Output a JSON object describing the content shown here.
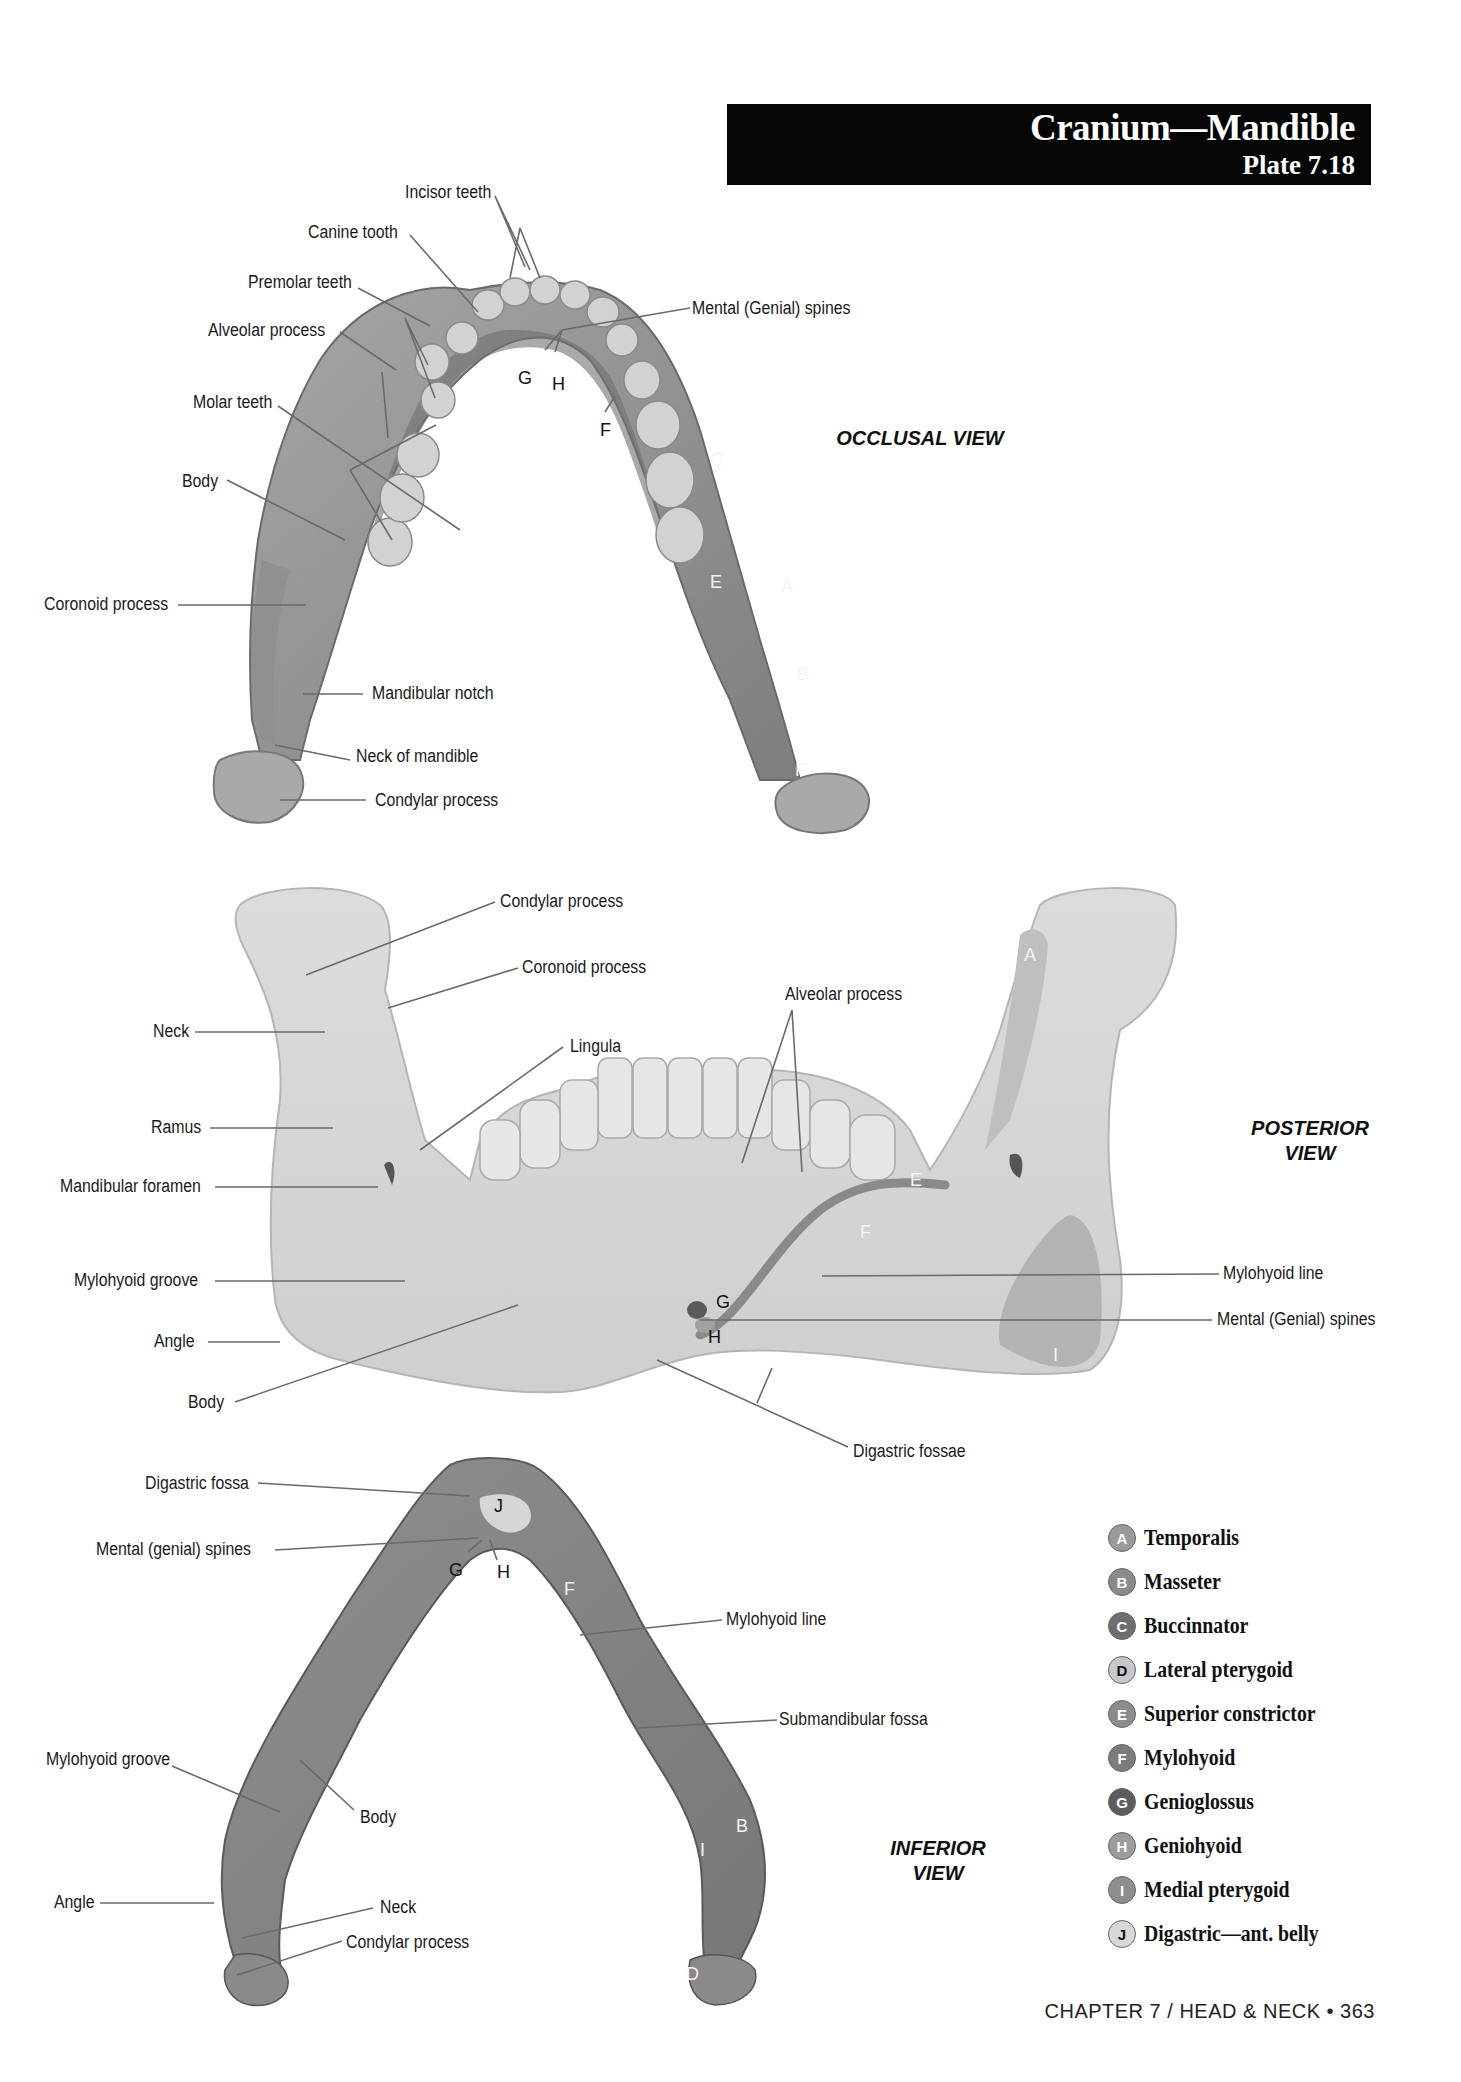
{
  "header": {
    "title": "Cranium—Mandible",
    "plate": "Plate 7.18"
  },
  "occlusal_view": {
    "view_label": [
      "OCCLUSAL",
      "VIEW"
    ],
    "labels": {
      "incisor_teeth": "Incisor teeth",
      "canine_tooth": "Canine tooth",
      "premolar_teeth": "Premolar teeth",
      "alveolar_process": "Alveolar process",
      "molar_teeth": "Molar teeth",
      "body": "Body",
      "coronoid_process": "Coronoid process",
      "mandibular_notch": "Mandibular notch",
      "neck_of_mandible": "Neck of mandible",
      "condylar_process": "Condylar process",
      "mental_spines": "Mental (Genial) spines"
    },
    "markers": {
      "G": "G",
      "H": "H",
      "F": "F",
      "C": "C",
      "E": "E",
      "A": "A",
      "B": "B",
      "F2": "F"
    }
  },
  "posterior_view": {
    "view_label": [
      "POSTERIOR",
      "VIEW"
    ],
    "labels": {
      "condylar_process": "Condylar process",
      "coronoid_process": "Coronoid process",
      "neck": "Neck",
      "lingula": "Lingula",
      "alveolar_process": "Alveolar process",
      "ramus": "Ramus",
      "mandibular_foramen": "Mandibular foramen",
      "mylohyoid_groove": "Mylohyoid groove",
      "angle": "Angle",
      "body": "Body",
      "mylohyoid_line": "Mylohyoid line",
      "mental_spines": "Mental (Genial) spines",
      "digastric_fossae": "Digastric fossae"
    },
    "markers": {
      "A": "A",
      "E": "E",
      "F": "F",
      "G": "G",
      "H": "H",
      "I": "I"
    }
  },
  "inferior_view": {
    "view_label": [
      "INFERIOR",
      "VIEW"
    ],
    "labels": {
      "digastric_fossa": "Digastric fossa",
      "mental_spines": "Mental (genial) spines",
      "mylohyoid_line": "Mylohyoid line",
      "submandibular_fossa": "Submandibular fossa",
      "mylohyoid_groove": "Mylohyoid groove",
      "body": "Body",
      "angle": "Angle",
      "neck": "Neck",
      "condylar_process": "Condylar process"
    },
    "markers": {
      "J": "J",
      "G": "G",
      "H": "H",
      "F": "F",
      "B": "B",
      "I": "I",
      "D": "D"
    }
  },
  "legend": {
    "items": [
      {
        "key": "A",
        "label": "Temporalis",
        "color": "#9a9a9a",
        "text": "#ffffff"
      },
      {
        "key": "B",
        "label": "Masseter",
        "color": "#8a8a8a",
        "text": "#ffffff"
      },
      {
        "key": "C",
        "label": "Buccinnator",
        "color": "#6e6e6e",
        "text": "#ffffff"
      },
      {
        "key": "D",
        "label": "Lateral pterygoid",
        "color": "#c8c8c8",
        "text": "#111111"
      },
      {
        "key": "E",
        "label": "Superior constrictor",
        "color": "#8c8c8c",
        "text": "#ffffff"
      },
      {
        "key": "F",
        "label": "Mylohyoid",
        "color": "#7c7c7c",
        "text": "#ffffff"
      },
      {
        "key": "G",
        "label": "Genioglossus",
        "color": "#5c5c5c",
        "text": "#ffffff"
      },
      {
        "key": "H",
        "label": "Geniohyoid",
        "color": "#9c9c9c",
        "text": "#ffffff"
      },
      {
        "key": "I",
        "label": "Medial pterygoid",
        "color": "#8e8e8e",
        "text": "#ffffff"
      },
      {
        "key": "J",
        "label": "Digastric—ant. belly",
        "color": "#d8d8d8",
        "text": "#111111"
      }
    ]
  },
  "footer": {
    "text": "CHAPTER 7 / HEAD & NECK • 363"
  }
}
